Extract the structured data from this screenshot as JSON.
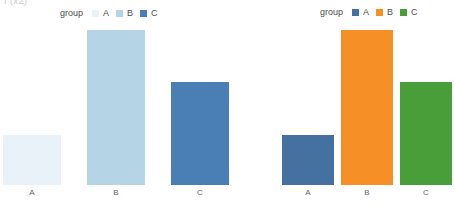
{
  "artifact_text": "f (x2)",
  "chart_data": [
    {
      "panel_id": "left",
      "type": "bar",
      "title": "",
      "xlabel": "",
      "ylabel": "",
      "categories": [
        "A",
        "B",
        "C"
      ],
      "values": [
        50,
        155,
        103
      ],
      "ylim": [
        0,
        157
      ],
      "grid": false,
      "legend": {
        "title": "group",
        "position": "top",
        "entries": [
          {
            "label": "A",
            "color": "#e8f2f8"
          },
          {
            "label": "B",
            "color": "#b5d5e6"
          },
          {
            "label": "C",
            "color": "#4a7fb5"
          }
        ]
      },
      "bars": [
        {
          "category": "A",
          "value": 50,
          "color": "#e8f2f8"
        },
        {
          "category": "B",
          "value": 155,
          "color": "#b5d5e6"
        },
        {
          "category": "C",
          "value": 103,
          "color": "#4a7fb5"
        }
      ]
    },
    {
      "panel_id": "right",
      "type": "bar",
      "title": "",
      "xlabel": "",
      "ylabel": "",
      "categories": [
        "A",
        "B",
        "C"
      ],
      "values": [
        50,
        155,
        103
      ],
      "ylim": [
        0,
        157
      ],
      "grid": false,
      "legend": {
        "title": "group",
        "position": "top",
        "entries": [
          {
            "label": "A",
            "color": "#44719f"
          },
          {
            "label": "B",
            "color": "#f68f25"
          },
          {
            "label": "C",
            "color": "#4a9e3a"
          }
        ]
      },
      "bars": [
        {
          "category": "A",
          "value": 50,
          "color": "#44719f"
        },
        {
          "category": "B",
          "value": 155,
          "color": "#f68f25"
        },
        {
          "category": "C",
          "value": 103,
          "color": "#4a9e3a"
        }
      ]
    }
  ]
}
